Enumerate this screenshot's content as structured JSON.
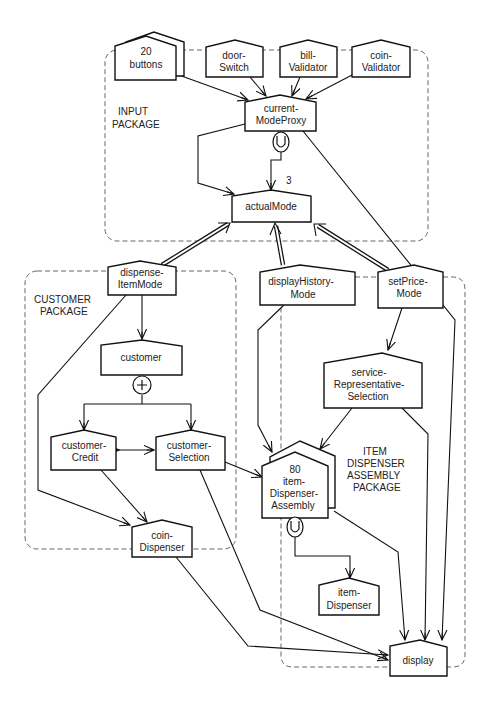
{
  "packages": [
    {
      "id": "input",
      "label_lines": [
        "INPUT",
        "PACKAGE"
      ]
    },
    {
      "id": "customer",
      "label_lines": [
        "CUSTOMER",
        "PACKAGE"
      ]
    },
    {
      "id": "item-dispenser-assembly",
      "label_lines": [
        "ITEM",
        "DISPENSER",
        "ASSEMBLY",
        "PACKAGE"
      ]
    }
  ],
  "nodes": {
    "buttons": {
      "lines": [
        "20",
        "buttons"
      ],
      "multiplicity": "20"
    },
    "doorSwitch": {
      "lines": [
        "door-",
        "Switch"
      ]
    },
    "billValidator": {
      "lines": [
        "bill-",
        "Validator"
      ]
    },
    "coinValidator": {
      "lines": [
        "coin-",
        "Validator"
      ]
    },
    "currentModeProxy": {
      "lines": [
        "current-",
        "ModeProxy"
      ]
    },
    "actualMode": {
      "lines": [
        "actualMode"
      ]
    },
    "dispenseItemMode": {
      "lines": [
        "dispense-",
        "ItemMode"
      ]
    },
    "displayHistoryMode": {
      "lines": [
        "displayHistory-",
        "Mode"
      ]
    },
    "setPriceMode": {
      "lines": [
        "setPrice-",
        "Mode"
      ]
    },
    "customer": {
      "lines": [
        "customer"
      ]
    },
    "customerCredit": {
      "lines": [
        "customer-",
        "Credit"
      ]
    },
    "customerSelection": {
      "lines": [
        "customer-",
        "Selection"
      ]
    },
    "serviceRepresentativeSelection": {
      "lines": [
        "service-",
        "Representative-",
        "Selection"
      ]
    },
    "itemDispenserAssembly": {
      "lines": [
        "80",
        "item-",
        "Dispenser-",
        "Assembly"
      ],
      "multiplicity": "80"
    },
    "coinDispenser": {
      "lines": [
        "coin-",
        "Dispenser"
      ]
    },
    "itemDispenser": {
      "lines": [
        "item-",
        "Dispenser"
      ]
    },
    "display": {
      "lines": [
        "display"
      ]
    }
  },
  "annotations": {
    "union_symbol": "∪",
    "plus_symbol": "+",
    "multiplicity_3": "3"
  }
}
